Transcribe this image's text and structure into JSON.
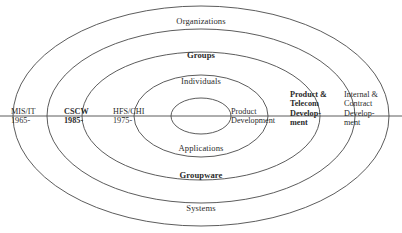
{
  "diagram": {
    "stroke_color": "#4a4a4a",
    "text_color": "#2b2b2b",
    "background": "#ffffff",
    "rings_top": [
      {
        "label": "Organizations",
        "bold": false
      },
      {
        "label": "Groups",
        "bold": true
      },
      {
        "label": "Individuals",
        "bold": false
      }
    ],
    "rings_bottom": [
      {
        "label": "Applications",
        "bold": false
      },
      {
        "label": "Groupware",
        "bold": true
      },
      {
        "label": "Systems",
        "bold": false
      }
    ],
    "axis_left": [
      {
        "name": "MIS/IT",
        "year": "1965-",
        "bold": false
      },
      {
        "name": "CSCW",
        "year": "1985-",
        "bold": true
      },
      {
        "name": "HFS/CHI",
        "year": "1975-",
        "bold": false
      }
    ],
    "axis_right": [
      {
        "line1": "Product",
        "line2": "Development",
        "line3": "",
        "line4": "",
        "bold": false
      },
      {
        "line1": "Product &",
        "line2": "Telecom",
        "line3": "Develop-",
        "line4": "ment",
        "bold": true
      },
      {
        "line1": "Internal &",
        "line2": "Contract",
        "line3": "Develop-",
        "line4": "ment",
        "bold": false
      }
    ]
  }
}
